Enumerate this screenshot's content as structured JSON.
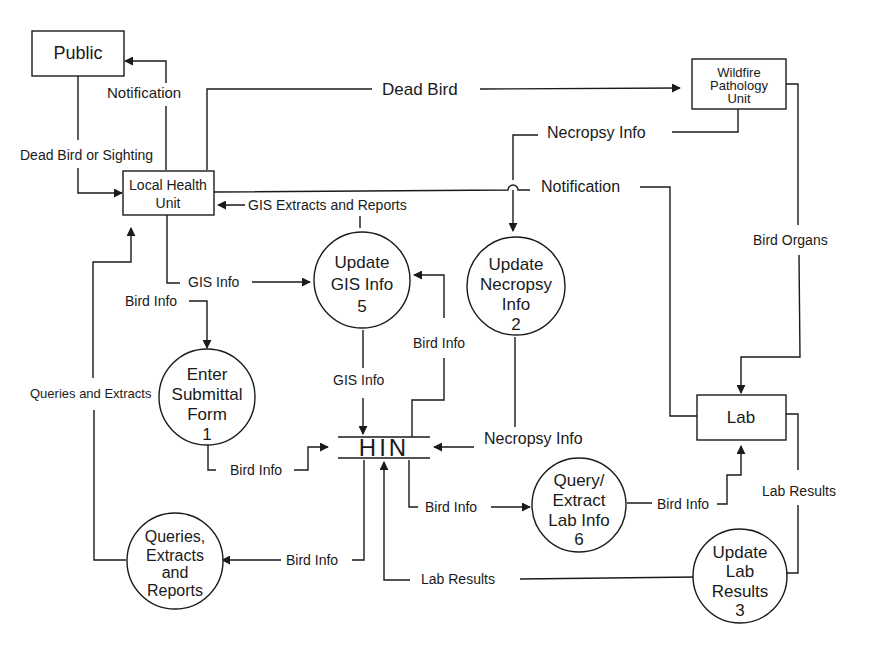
{
  "diagram": {
    "type": "data-flow-diagram",
    "entities": {
      "public": "Public",
      "local_health_unit": [
        "Local Health",
        "Unit"
      ],
      "wildfire": [
        "Wildfire",
        "Pathology",
        "Unit"
      ],
      "lab": "Lab"
    },
    "processes": {
      "enter_submittal": [
        "Enter",
        "Submittal",
        "Form",
        "1"
      ],
      "update_necropsy": [
        "Update",
        "Necropsy",
        "Info",
        "2"
      ],
      "update_lab": [
        "Update",
        "Lab",
        "Results",
        "3"
      ],
      "update_gis": [
        "Update",
        "GIS Info",
        "5"
      ],
      "query_extract": [
        "Query/",
        "Extract",
        "Lab Info",
        "6"
      ],
      "queries_reports": [
        "Queries,",
        "Extracts",
        "and",
        "Reports"
      ]
    },
    "datastore": {
      "hin": "HIN"
    },
    "flows": {
      "notification_public": "Notification",
      "dead_bird": "Dead Bird",
      "dead_bird_or_sighting": "Dead Bird or Sighting",
      "necropsy_info_top": "Necropsy Info",
      "notification_lab": "Notification",
      "gis_extracts": "GIS Extracts and Reports",
      "bird_organs": "Bird Organs",
      "gis_info_in": "GIS Info",
      "bird_info_enter": "Bird Info",
      "queries_extracts": "Queries and Extracts",
      "gis_info_hin": "GIS Info",
      "bird_info_gis": "Bird Info",
      "necropsy_info_hin": "Necropsy Info",
      "bird_info_form_hin": "Bird Info",
      "bird_info_query": "Bird Info",
      "bird_info_lab": "Bird Info",
      "lab_results_right": "Lab Results",
      "bird_info_reports": "Bird Info",
      "lab_results_hin": "Lab Results"
    }
  }
}
